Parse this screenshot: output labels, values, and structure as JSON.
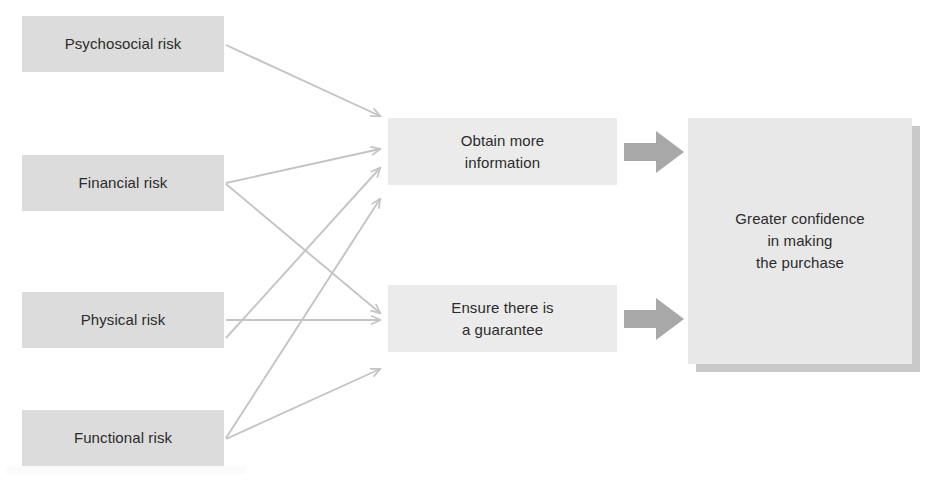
{
  "diagram": {
    "type": "flow-diagram",
    "colors": {
      "risk_box_fill": "#dcdcdc",
      "action_box_fill": "#ebebeb",
      "outcome_box_fill": "#e8e8e8",
      "outcome_box_shadow": "#c9c9c9",
      "thin_arrow": "#c4c4c4",
      "block_arrow": "#a8a8a8",
      "text": "#2b2b2b",
      "background": "#ffffff"
    },
    "risks": [
      {
        "id": "psychosocial",
        "label": "Psychosocial risk",
        "x": 22,
        "y": 16
      },
      {
        "id": "financial",
        "label": "Financial risk",
        "x": 22,
        "y": 155
      },
      {
        "id": "physical",
        "label": "Physical risk",
        "x": 22,
        "y": 292
      },
      {
        "id": "functional",
        "label": "Functional risk",
        "x": 22,
        "y": 410
      }
    ],
    "actions": [
      {
        "id": "obtain-info",
        "line1": "Obtain more",
        "line2": "information",
        "x": 388,
        "y": 118
      },
      {
        "id": "guarantee",
        "line1": "Ensure there is",
        "line2": "a guarantee",
        "x": 388,
        "y": 285
      }
    ],
    "outcome": {
      "id": "greater-confidence",
      "line1": "Greater confidence",
      "line2": "in making",
      "line3": "the purchase",
      "x": 688,
      "y": 118
    },
    "connections": [
      {
        "from": "psychosocial",
        "to": "obtain-info"
      },
      {
        "from": "financial",
        "to": "obtain-info"
      },
      {
        "from": "financial",
        "to": "guarantee"
      },
      {
        "from": "physical",
        "to": "obtain-info"
      },
      {
        "from": "physical",
        "to": "guarantee"
      },
      {
        "from": "functional",
        "to": "obtain-info"
      },
      {
        "from": "functional",
        "to": "guarantee"
      },
      {
        "from": "obtain-info",
        "to": "greater-confidence",
        "style": "block-arrow"
      },
      {
        "from": "guarantee",
        "to": "greater-confidence",
        "style": "block-arrow"
      }
    ]
  }
}
